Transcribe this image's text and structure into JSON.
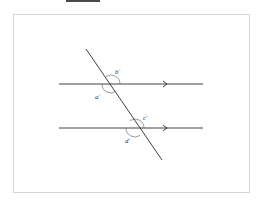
{
  "diagram": {
    "line_color": "#2b2b2b",
    "arc_color": "#555555",
    "frame_color": "#d6d6d6",
    "angles": [
      {
        "id": "b",
        "label": "b",
        "mark": "°",
        "intersection": "upper",
        "position": "above-right"
      },
      {
        "id": "a",
        "label": "a",
        "mark": "°",
        "intersection": "upper",
        "position": "below-left"
      },
      {
        "id": "c",
        "label": "c",
        "mark": "°",
        "intersection": "lower",
        "position": "above-right"
      },
      {
        "id": "d",
        "label": "d",
        "mark": "°",
        "intersection": "lower",
        "position": "below-left"
      }
    ]
  }
}
